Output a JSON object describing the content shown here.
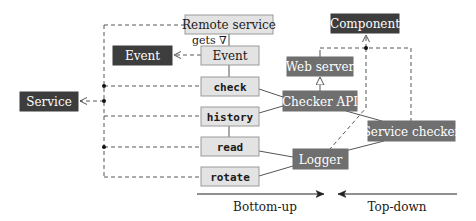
{
  "diagram": {
    "nodes": {
      "remote_service": "Remote service",
      "gets_label": "gets ∇",
      "event_light": "Event",
      "event_dark": "Event",
      "check": "check",
      "history": "history",
      "read": "read",
      "rotate": "rotate",
      "service": "Service",
      "component": "Component",
      "web_server": "Web server",
      "checker_api": "Checker API",
      "service_checker": "Service checker",
      "logger": "Logger"
    },
    "axis": {
      "bottom_up": "Bottom-up",
      "top_down": "Top-down"
    },
    "colors": {
      "light_box": "#e3e3e3",
      "dark_box": "#3d3d3d",
      "mid_box": "#6f6f6f"
    }
  }
}
